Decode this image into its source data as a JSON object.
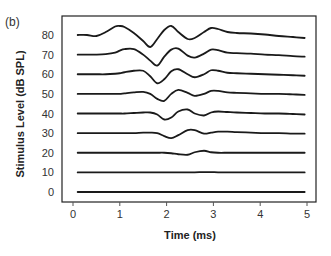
{
  "chart_data": {
    "type": "line",
    "panel_label": "(b)",
    "title": "",
    "xlabel": "Time (ms)",
    "ylabel": "Stimulus Level (dB SPL)",
    "xlim": [
      0,
      5
    ],
    "xticks": [
      "0",
      "1",
      "2",
      "3",
      "4",
      "5"
    ],
    "yticks": [
      "0",
      "10",
      "20",
      "30",
      "40",
      "50",
      "60",
      "70",
      "80"
    ],
    "ylim": [
      0,
      80
    ],
    "grid": false,
    "legend": "none",
    "amplitude_units": "arbitrary (traces offset by stimulus level)",
    "line_color": "#1a1a1a",
    "x": [
      0.1,
      0.3,
      0.5,
      0.7,
      0.9,
      1.0,
      1.1,
      1.3,
      1.5,
      1.65,
      1.8,
      1.95,
      2.1,
      2.25,
      2.45,
      2.6,
      2.8,
      2.95,
      3.1,
      3.3,
      3.5,
      3.8,
      4.1,
      4.4,
      4.7,
      4.95
    ],
    "series": [
      {
        "name": "80",
        "level": 80,
        "values": [
          0,
          0,
          -1,
          3,
          8.5,
          9,
          8,
          2,
          -6,
          -12,
          -4,
          5,
          9,
          3,
          -4,
          -3,
          3,
          7,
          6,
          3,
          2,
          1.5,
          0.5,
          -1,
          -2,
          -3
        ]
      },
      {
        "name": "70",
        "level": 70,
        "values": [
          0,
          0,
          0,
          0.5,
          2,
          4,
          5.5,
          5.5,
          0,
          -6,
          -11,
          -2,
          5,
          6,
          -1,
          -3,
          1,
          5,
          4.5,
          2,
          1.5,
          1,
          0,
          -0.5,
          -1.5,
          -2
        ]
      },
      {
        "name": "60",
        "level": 60,
        "values": [
          0,
          0,
          0,
          0,
          0.5,
          1,
          2,
          3.5,
          3.5,
          -2,
          -9,
          -5,
          3,
          5,
          0,
          -3,
          0,
          4,
          3.5,
          1.5,
          1,
          0.5,
          0,
          -0.5,
          -1,
          -1.5
        ]
      },
      {
        "name": "50",
        "level": 50,
        "values": [
          0,
          0,
          0,
          0,
          0,
          0,
          0.5,
          1.5,
          2,
          0,
          -5,
          -7,
          0,
          4,
          1,
          -2,
          0,
          3,
          3,
          1.5,
          1,
          0.5,
          0,
          0,
          -0.5,
          -1
        ]
      },
      {
        "name": "40",
        "level": 40,
        "values": [
          0,
          0,
          0,
          0,
          0,
          0,
          0,
          0.5,
          1,
          1,
          -1,
          -6,
          -4,
          2,
          4,
          0,
          -2,
          1,
          2,
          1.5,
          1,
          0.5,
          0,
          0,
          -0.5,
          -1
        ]
      },
      {
        "name": "30",
        "level": 30,
        "values": [
          0,
          0,
          0,
          0,
          0,
          0,
          0,
          0,
          0.5,
          0.5,
          0,
          -3,
          -5,
          -2,
          3,
          3,
          -0.5,
          0.5,
          1.5,
          1.5,
          1,
          0.5,
          0,
          0,
          -0.5,
          -0.5
        ]
      },
      {
        "name": "20",
        "level": 20,
        "values": [
          0,
          0,
          0,
          0,
          0,
          0,
          0,
          0,
          0,
          0,
          0,
          0,
          -0.5,
          -1.5,
          -2,
          0.5,
          2,
          0.5,
          0,
          0,
          0,
          0,
          0,
          0,
          0,
          0
        ]
      },
      {
        "name": "10",
        "level": 10,
        "values": [
          0,
          0,
          0,
          0,
          0,
          0,
          0,
          0,
          0,
          0,
          0,
          0,
          0,
          0,
          0,
          0,
          0.3,
          0.3,
          0,
          0,
          0,
          0,
          0,
          0,
          0,
          0
        ]
      },
      {
        "name": "0",
        "level": 0,
        "values": [
          0,
          0,
          0,
          0,
          0,
          0,
          0,
          0,
          0,
          0,
          0,
          0,
          0,
          0,
          0,
          0,
          0,
          0,
          0,
          0,
          0,
          0,
          0,
          0,
          0,
          0
        ]
      }
    ]
  }
}
